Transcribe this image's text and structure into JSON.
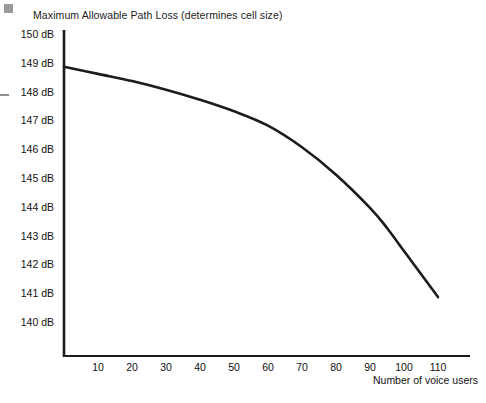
{
  "chart_data": {
    "type": "line",
    "title": "Maximum Allowable Path Loss (determines cell size)",
    "xlabel": "Number of voice users",
    "ylabel": "",
    "xlim": [
      0,
      120
    ],
    "ylim": [
      139.5,
      150
    ],
    "grid": false,
    "legend": "none",
    "x_ticks": [
      10,
      20,
      30,
      40,
      50,
      60,
      70,
      80,
      90,
      100,
      110
    ],
    "x_tick_labels": [
      "10",
      "20",
      "30",
      "40",
      "50",
      "60",
      "70",
      "80",
      "90",
      "100",
      "110"
    ],
    "y_ticks": [
      140,
      141,
      142,
      143,
      144,
      145,
      146,
      147,
      148,
      149,
      150
    ],
    "y_tick_labels": [
      "140 dB",
      "141 dB",
      "142 dB",
      "143 dB",
      "144 dB",
      "145 dB",
      "146 dB",
      "147 dB",
      "148 dB",
      "149 dB",
      "150 dB"
    ],
    "series": [
      {
        "name": "Maximum allowable path loss",
        "color": "#1c1c1c",
        "x": [
          0,
          10,
          20,
          30,
          40,
          50,
          60,
          70,
          80,
          90,
          95,
          100,
          105,
          110
        ],
        "y": [
          148.9,
          148.65,
          148.4,
          148.1,
          147.75,
          147.35,
          146.85,
          146.1,
          145.15,
          144.0,
          143.3,
          142.5,
          141.7,
          140.9
        ]
      }
    ]
  },
  "axes": {
    "axis_color": "#1c1c1c"
  },
  "artifacts": {
    "corner_mark": "gray-square",
    "edge_mark": "gray-dash"
  }
}
